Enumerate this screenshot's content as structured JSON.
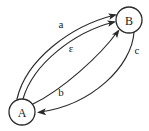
{
  "diagram": {
    "type": "state-transition-graph",
    "canvas": {
      "width": 149,
      "height": 131,
      "background": "#ffffff"
    },
    "stroke_color": "#2a2a2a",
    "text_color": "#1a1a1a",
    "nodes": [
      {
        "id": "A",
        "label": "A",
        "cx": 22,
        "cy": 112,
        "r": 13
      },
      {
        "id": "B",
        "label": "B",
        "cx": 129,
        "cy": 20,
        "r": 13
      }
    ],
    "edges": [
      {
        "id": "edge-a",
        "label": "a",
        "from": "A",
        "to": "B",
        "label_x": 61,
        "label_y": 24,
        "path": "M 17 99 C 26 60, 70 26, 115 15",
        "arrow_x": 117,
        "arrow_y": 14.6,
        "arrow_angle": -13
      },
      {
        "id": "edge-epsilon",
        "label": "ε",
        "from": "A",
        "to": "B",
        "label_x": 71,
        "label_y": 48,
        "path": "M 23 99 C 33 64, 74 32, 114 22",
        "arrow_x": 116,
        "arrow_y": 21.6,
        "arrow_angle": -13
      },
      {
        "id": "edge-b",
        "label": "b",
        "from": "A",
        "to": "B",
        "label_x": 61,
        "label_y": 92,
        "path": "M 33 104 C 62 90, 100 56, 118 31",
        "arrow_x": 119.5,
        "arrow_y": 29.5,
        "arrow_angle": -54
      },
      {
        "id": "edge-c",
        "label": "c",
        "from": "B",
        "to": "A",
        "label_x": 137,
        "label_y": 50,
        "path": "M 134 32 C 132 66, 92 105, 40 112",
        "arrow_x": 37,
        "arrow_y": 112.4,
        "arrow_angle": 176
      }
    ]
  }
}
